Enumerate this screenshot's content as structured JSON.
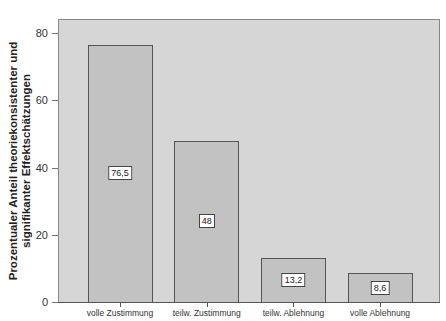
{
  "chart_data": {
    "type": "bar",
    "title": "",
    "xlabel": "",
    "ylabel": "Prozentualer Anteil theoriekonsistenter und signifikanter Effektschätzungen",
    "ylabel_lines": [
      "Prozentualer Anteil theoriekonsistenter und",
      "signifikanter Effektschätzungen"
    ],
    "categories": [
      "volle Zustimmung",
      "teilw. Zustimmung",
      "teilw. Ablehnung",
      "volle Ablehnung"
    ],
    "values": [
      76.5,
      48,
      13.2,
      8.6
    ],
    "value_labels": [
      "76,5",
      "48",
      "13,2",
      "8,6"
    ],
    "ylim": [
      0,
      84
    ],
    "yticks": [
      0,
      20,
      40,
      60,
      80
    ],
    "ytick_labels": [
      "0",
      "20",
      "40",
      "60",
      "80"
    ],
    "grid": false,
    "legend": null,
    "colors": {
      "plot_background": "#d6d6d6",
      "bar_fill": "#c2c2c2",
      "bar_border": "#555555"
    }
  }
}
